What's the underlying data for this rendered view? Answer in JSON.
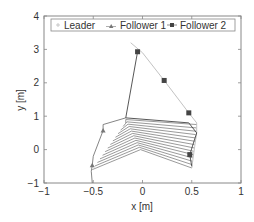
{
  "chart_data": {
    "type": "line",
    "title": "",
    "xlabel": "x [m]",
    "ylabel": "y [m]",
    "xlim": [
      -1,
      1
    ],
    "ylim": [
      -1,
      4
    ],
    "xticks": [
      -1,
      -0.5,
      0,
      0.5,
      1
    ],
    "xtick_labels": [
      "−1",
      "−0.5",
      "0",
      "0.5",
      "1"
    ],
    "yticks": [
      -1,
      0,
      1,
      2,
      3,
      4
    ],
    "ytick_labels": [
      "−1",
      "0",
      "1",
      "2",
      "3",
      "4"
    ],
    "grid": false,
    "legend_position": "top",
    "legend": [
      "Leader",
      "Follower 1",
      "Follower 2"
    ],
    "series": [
      {
        "name": "Leader",
        "marker": "plus",
        "color": "#bbbbbb",
        "points": [
          [
            -0.12,
            3.2
          ],
          [
            0.0,
            2.9
          ],
          [
            0.22,
            2.07
          ],
          [
            0.47,
            1.1
          ],
          [
            0.55,
            0.8
          ],
          [
            0.55,
            0.5
          ],
          [
            0.53,
            0.1
          ],
          [
            0.5,
            -0.55
          ]
        ]
      },
      {
        "name": "Follower 1",
        "marker": "triangle",
        "color": "#777777",
        "points": [
          [
            -0.17,
            0.95
          ],
          [
            -0.4,
            0.75
          ],
          [
            -0.4,
            0.57
          ],
          [
            -0.5,
            -0.2
          ],
          [
            -0.51,
            -0.47
          ],
          [
            -0.52,
            -0.65
          ],
          [
            -0.51,
            -1.0
          ]
        ]
      },
      {
        "name": "Follower 2",
        "marker": "square",
        "color": "#444444",
        "points": [
          [
            -0.05,
            2.93
          ],
          [
            -0.17,
            0.95
          ],
          [
            0.47,
            0.8
          ],
          [
            0.55,
            0.5
          ],
          [
            0.48,
            -0.15
          ],
          [
            0.5,
            -0.5
          ]
        ]
      }
    ],
    "markers": {
      "Follower 1": [
        [
          -0.4,
          0.57
        ],
        [
          -0.51,
          -0.47
        ]
      ],
      "Follower 2": [
        [
          -0.05,
          2.93
        ],
        [
          0.22,
          2.07
        ],
        [
          0.47,
          1.1
        ],
        [
          0.48,
          -0.15
        ]
      ]
    },
    "formation_links": {
      "description": "Connecting lines between robots over time (formation polygons)",
      "count": 14,
      "apex_x": 0.0,
      "apex_y_range": [
        0.0,
        0.9
      ],
      "left_x_range": [
        -0.51,
        -0.17
      ],
      "right_x": 0.52
    }
  },
  "axes": {
    "xlabel": "x [m]",
    "ylabel": "y [m]"
  },
  "legend": {
    "items": [
      {
        "label": "Leader",
        "marker": "plus"
      },
      {
        "label": "Follower 1",
        "marker": "triangle"
      },
      {
        "label": "Follower 2",
        "marker": "square"
      }
    ]
  }
}
